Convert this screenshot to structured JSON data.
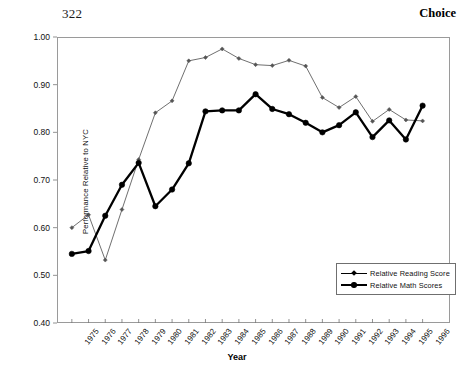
{
  "page": {
    "folio": "322",
    "book_title": "Choice"
  },
  "chart_data": {
    "type": "line",
    "title": "",
    "xlabel": "Year",
    "ylabel": "Performance Relative to NYC",
    "categories": [
      "1975",
      "1976",
      "1977",
      "1978",
      "1979",
      "1980",
      "1981",
      "1982",
      "1983",
      "1984",
      "1985",
      "1986",
      "1987",
      "1988",
      "1989",
      "1990",
      "1991",
      "1992",
      "1993",
      "1994",
      "1995",
      "1996"
    ],
    "x": [
      1975,
      1976,
      1977,
      1978,
      1979,
      1980,
      1981,
      1982,
      1983,
      1984,
      1985,
      1986,
      1987,
      1988,
      1989,
      1990,
      1991,
      1992,
      1993,
      1994,
      1995,
      1996
    ],
    "ylim": [
      0.4,
      1.0
    ],
    "yticks": [
      "1.00",
      "0.90",
      "0.80",
      "0.70",
      "0.60",
      "0.50",
      "0.40"
    ],
    "ytick_values": [
      1.0,
      0.9,
      0.8,
      0.7,
      0.6,
      0.5,
      0.4
    ],
    "grid": false,
    "legend_position": "bottom-right",
    "series": [
      {
        "name": "Relative Reading Score",
        "marker": "diamond",
        "line_weight": "thin",
        "color": "#555555",
        "values": [
          0.6,
          0.627,
          0.532,
          0.638,
          0.743,
          0.841,
          0.866,
          0.95,
          0.957,
          0.975,
          0.955,
          0.942,
          0.94,
          0.951,
          0.939,
          0.873,
          0.852,
          0.875,
          0.823,
          0.848,
          0.826,
          0.824
        ]
      },
      {
        "name": "Relative Math Scores",
        "marker": "circle",
        "line_weight": "thick",
        "color": "#000000",
        "values": [
          0.545,
          0.551,
          0.625,
          0.69,
          0.736,
          0.645,
          0.68,
          0.735,
          0.844,
          0.846,
          0.846,
          0.88,
          0.849,
          0.838,
          0.82,
          0.8,
          0.815,
          0.842,
          0.79,
          0.825,
          0.785,
          0.856
        ]
      }
    ]
  },
  "legend": {
    "items": [
      {
        "label": "Relative Reading Score"
      },
      {
        "label": "Relative Math Scores"
      }
    ]
  }
}
